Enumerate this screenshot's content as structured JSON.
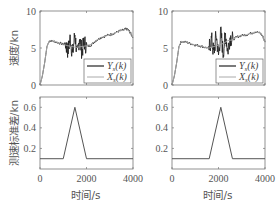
{
  "figure": {
    "ylabel_top": "速度/kn",
    "ylabel_bottom": "测速标准差/kn",
    "xlabel": "时间/s",
    "legend": [
      "Y_s(k)",
      "X_s(k)"
    ]
  },
  "chart_data": [
    {
      "type": "line",
      "position": "top-left",
      "title": "",
      "xlabel": "",
      "ylabel": "速度/kn",
      "xlim": [
        0,
        4000
      ],
      "ylim": [
        0,
        10
      ],
      "yticks": [
        0,
        5,
        10
      ],
      "xticks": [
        0,
        2000,
        4000
      ],
      "xticklabels_shown": false,
      "legend_position": "lower right",
      "series": [
        {
          "name": "Y_s(k)",
          "style": "dark noisy measurement",
          "x": [
            0,
            100,
            200,
            300,
            400,
            600,
            800,
            1000,
            1100,
            1200,
            1300,
            1400,
            1500,
            1600,
            1700,
            1800,
            1900,
            2000,
            2200,
            2400,
            2600,
            2800,
            3000,
            3200,
            3400,
            3600,
            3700,
            3800,
            3900,
            4000
          ],
          "y": [
            0,
            1.2,
            3.0,
            5.2,
            6.0,
            5.9,
            5.7,
            5.5,
            5.6,
            4.6,
            6.4,
            4.1,
            6.9,
            3.9,
            6.5,
            4.5,
            5.8,
            5.2,
            5.4,
            6.0,
            6.4,
            6.6,
            6.8,
            7.0,
            7.3,
            7.4,
            7.6,
            7.4,
            7.0,
            6.4
          ],
          "noise_interval": [
            1100,
            2000
          ]
        },
        {
          "name": "X_s(k)",
          "style": "light smooth reference",
          "x": [
            0,
            100,
            200,
            300,
            400,
            600,
            800,
            1000,
            1200,
            1400,
            1500,
            1600,
            1800,
            2000,
            2200,
            2400,
            2600,
            2800,
            3000,
            3200,
            3400,
            3600,
            3700,
            3800,
            3900,
            4000
          ],
          "y": [
            0,
            1.2,
            3.0,
            5.2,
            6.0,
            5.9,
            5.7,
            5.5,
            5.3,
            5.2,
            5.1,
            5.1,
            5.2,
            5.3,
            5.5,
            6.0,
            6.4,
            6.6,
            6.8,
            7.0,
            7.3,
            7.4,
            7.6,
            7.4,
            7.0,
            6.4
          ]
        }
      ]
    },
    {
      "type": "line",
      "position": "top-right",
      "title": "",
      "xlabel": "",
      "ylabel": "",
      "xlim": [
        0,
        4000
      ],
      "ylim": [
        0,
        10
      ],
      "yticks": [
        0,
        5,
        10
      ],
      "xticks": [
        0,
        2000,
        4000
      ],
      "xticklabels_shown": false,
      "legend_position": "lower right",
      "series": [
        {
          "name": "Y_s(k)",
          "style": "dark noisy measurement",
          "x": [
            0,
            100,
            200,
            300,
            400,
            600,
            800,
            1000,
            1200,
            1400,
            1600,
            1700,
            1800,
            1900,
            2000,
            2100,
            2200,
            2300,
            2400,
            2500,
            2600,
            2800,
            3000,
            3200,
            3400,
            3600,
            3800,
            3900,
            4000
          ],
          "y": [
            0,
            1.2,
            3.0,
            5.2,
            5.9,
            5.8,
            5.6,
            5.4,
            5.3,
            5.1,
            5.0,
            6.2,
            4.2,
            6.8,
            4.0,
            7.2,
            4.3,
            6.9,
            4.6,
            6.5,
            6.1,
            6.5,
            6.7,
            6.8,
            7.0,
            7.2,
            7.0,
            6.6,
            5.8
          ],
          "noise_interval": [
            1600,
            2600
          ]
        },
        {
          "name": "X_s(k)",
          "style": "light smooth reference",
          "x": [
            0,
            100,
            200,
            300,
            400,
            600,
            800,
            1000,
            1200,
            1400,
            1600,
            1800,
            2000,
            2200,
            2400,
            2600,
            2800,
            3000,
            3200,
            3400,
            3600,
            3800,
            3900,
            4000
          ],
          "y": [
            0,
            1.2,
            3.0,
            5.2,
            5.9,
            5.8,
            5.6,
            5.4,
            5.3,
            5.1,
            5.0,
            5.2,
            5.4,
            5.6,
            6.0,
            6.1,
            6.5,
            6.7,
            6.8,
            7.0,
            7.2,
            7.0,
            6.6,
            5.8
          ]
        }
      ]
    },
    {
      "type": "line",
      "position": "bottom-left",
      "title": "",
      "xlabel": "时间/s",
      "ylabel": "测速标准差/kn",
      "xlim": [
        0,
        4000
      ],
      "ylim": [
        0,
        0.7
      ],
      "yticks": [
        0.2,
        0.4,
        0.6
      ],
      "xticks": [
        0,
        2000,
        4000
      ],
      "series": [
        {
          "name": "std",
          "x": [
            0,
            1000,
            1500,
            2000,
            4000
          ],
          "y": [
            0.1,
            0.1,
            0.6,
            0.1,
            0.1
          ]
        }
      ]
    },
    {
      "type": "line",
      "position": "bottom-right",
      "title": "",
      "xlabel": "时间/s",
      "ylabel": "",
      "xlim": [
        0,
        4000
      ],
      "ylim": [
        0,
        0.7
      ],
      "yticks": [
        0.2,
        0.4,
        0.6
      ],
      "xticks": [
        0,
        2000,
        4000
      ],
      "series": [
        {
          "name": "std",
          "x": [
            0,
            1600,
            2100,
            2600,
            4000
          ],
          "y": [
            0.1,
            0.1,
            0.6,
            0.1,
            0.1
          ]
        }
      ]
    }
  ]
}
